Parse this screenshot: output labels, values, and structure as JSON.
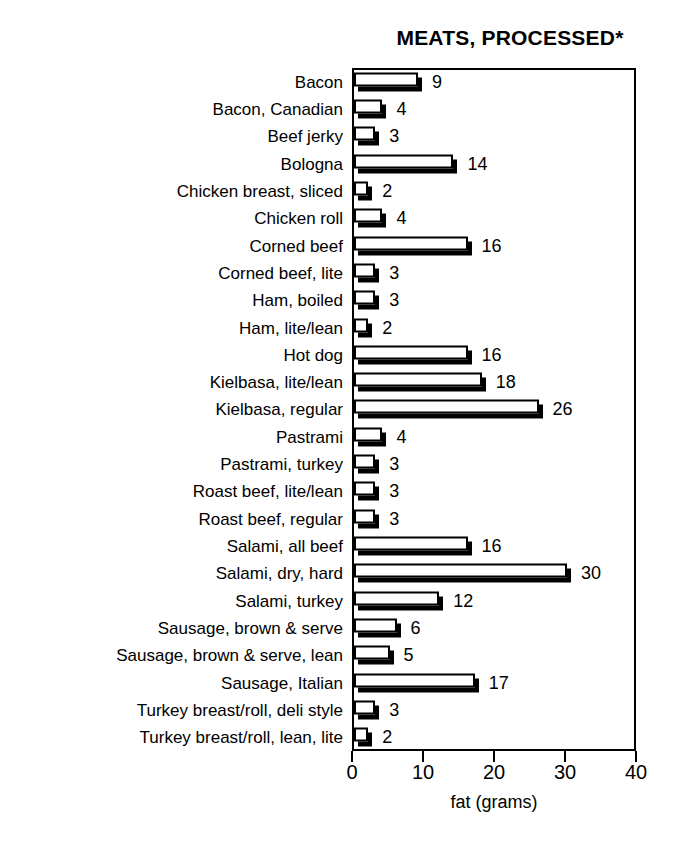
{
  "chart_data": {
    "type": "bar",
    "orientation": "horizontal",
    "title": "MEATS, PROCESSED*",
    "xlabel": "fat (grams)",
    "ylabel": "",
    "xlim": [
      0,
      40
    ],
    "xticks": [
      0,
      10,
      20,
      30,
      40
    ],
    "xtick_labels": [
      "0",
      "10",
      "20",
      "30",
      "40"
    ],
    "grid": false,
    "legend": false,
    "style": "3d-shadow-bars",
    "categories": [
      "Bacon",
      "Bacon, Canadian",
      "Beef jerky",
      "Bologna",
      "Chicken breast, sliced",
      "Chicken roll",
      "Corned beef",
      "Corned beef, lite",
      "Ham, boiled",
      "Ham, lite/lean",
      "Hot dog",
      "Kielbasa, lite/lean",
      "Kielbasa, regular",
      "Pastrami",
      "Pastrami, turkey",
      "Roast beef, lite/lean",
      "Roast beef, regular",
      "Salami, all beef",
      "Salami, dry, hard",
      "Salami, turkey",
      "Sausage, brown & serve",
      "Sausage, brown & serve, lean",
      "Sausage, Italian",
      "Turkey breast/roll, deli style",
      "Turkey breast/roll, lean, lite"
    ],
    "values": [
      9,
      4,
      3,
      14,
      2,
      4,
      16,
      3,
      3,
      2,
      16,
      18,
      26,
      4,
      3,
      3,
      3,
      16,
      30,
      12,
      6,
      5,
      17,
      3,
      2
    ],
    "value_labels": [
      "9",
      "4",
      "3",
      "14",
      "2",
      "4",
      "16",
      "3",
      "3",
      "2",
      "16",
      "18",
      "26",
      "4",
      "3",
      "3",
      "3",
      "16",
      "30",
      "12",
      "6",
      "5",
      "17",
      "3",
      "2"
    ],
    "colors": {
      "bar_face": "#ffffff",
      "bar_outline": "#000000",
      "bar_shadow": "#000000",
      "text": "#000000",
      "background": "#ffffff"
    }
  }
}
